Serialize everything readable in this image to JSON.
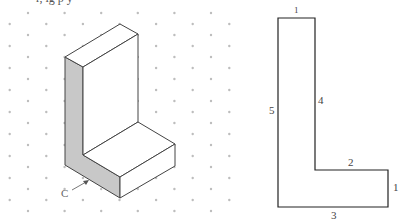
{
  "figure": {
    "clipped_top_text": "r, ig  p   y",
    "isometric": {
      "label_c": "C",
      "shaded_face_color": "#c8c8c8",
      "line_color": "#444444",
      "dot_color": "#bdbdbd"
    },
    "orthographic": {
      "edge_labels": [
        "1",
        "2",
        "3",
        "4",
        "5",
        "1"
      ],
      "label_top": "1",
      "label_step_right": "1",
      "label_step_top": "2",
      "label_bottom": "3",
      "label_inner_vertical": "4",
      "label_outer_vertical": "5",
      "line_color": "#222222"
    }
  }
}
